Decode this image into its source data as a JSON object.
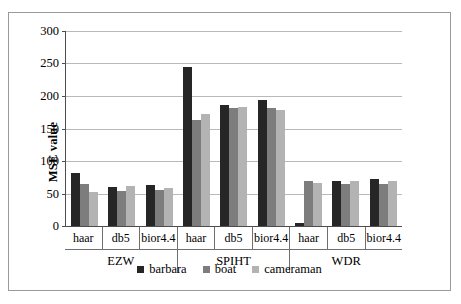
{
  "chart_data": {
    "type": "bar",
    "title": "",
    "xlabel": "",
    "ylabel": "MSE value",
    "ylim": [
      0,
      300
    ],
    "yticks": [
      0,
      50,
      100,
      150,
      200,
      250,
      300
    ],
    "grid": "horizontal",
    "legend_position": "bottom-center",
    "categories": [
      "haar",
      "db5",
      "bior4.4",
      "haar",
      "db5",
      "bior4.4",
      "haar",
      "db5",
      "bior4.4"
    ],
    "group_labels": [
      "EZW",
      "SPIHT",
      "WDR"
    ],
    "group_span": 3,
    "series": [
      {
        "name": "barbara",
        "color": "#262626",
        "values": [
          82,
          60,
          63,
          245,
          186,
          194,
          4,
          70,
          72
        ]
      },
      {
        "name": "boat",
        "color": "#7d7d7d",
        "values": [
          64,
          54,
          55,
          163,
          182,
          181,
          70,
          64,
          65
        ]
      },
      {
        "name": "cameraman",
        "color": "#b3b3b3",
        "values": [
          53,
          61,
          59,
          172,
          183,
          178,
          66,
          70,
          69
        ]
      }
    ]
  },
  "axis": {
    "y_title": "MSE value",
    "tick_labels": [
      "300",
      "250",
      "200",
      "150",
      "100",
      "50",
      "0"
    ]
  },
  "legend": {
    "items": [
      {
        "label": "barbara"
      },
      {
        "label": "boat"
      },
      {
        "label": "cameraman"
      }
    ]
  }
}
